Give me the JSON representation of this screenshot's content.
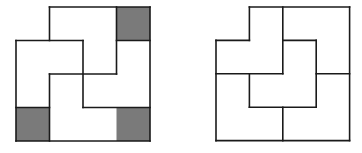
{
  "figures": [
    {
      "name": "left-puzzle",
      "origin": [
        16,
        7
      ],
      "unit": 33.5,
      "shaded_cells": [
        [
          3,
          0
        ],
        [
          0,
          3
        ],
        [
          3,
          3
        ]
      ],
      "shade_color": "#7a7a7a",
      "segments": [
        [
          1,
          0,
          4,
          0
        ],
        [
          4,
          0,
          4,
          4
        ],
        [
          0,
          4,
          4,
          4
        ],
        [
          0,
          1,
          0,
          4
        ],
        [
          0,
          1,
          2,
          1
        ],
        [
          1,
          0,
          1,
          1
        ],
        [
          2,
          1,
          2,
          3
        ],
        [
          1,
          2,
          3,
          2
        ],
        [
          3,
          0,
          3,
          2
        ],
        [
          3,
          1,
          4,
          1
        ],
        [
          1,
          2,
          1,
          4
        ],
        [
          2,
          3,
          4,
          3
        ],
        [
          0,
          3,
          1,
          3
        ]
      ]
    },
    {
      "name": "right-puzzle",
      "origin": [
        216,
        7
      ],
      "unit": 33.4,
      "shaded_cells": [],
      "shade_color": "#7a7a7a",
      "segments": [
        [
          1,
          0,
          4,
          0
        ],
        [
          4,
          0,
          4,
          4
        ],
        [
          0,
          4,
          4,
          4
        ],
        [
          0,
          1,
          0,
          4
        ],
        [
          0,
          1,
          1,
          1
        ],
        [
          1,
          1,
          1,
          0
        ],
        [
          2,
          0,
          2,
          2
        ],
        [
          0,
          2,
          2,
          2
        ],
        [
          2,
          1,
          3,
          1
        ],
        [
          3,
          1,
          3,
          3
        ],
        [
          1,
          3,
          3,
          3
        ],
        [
          1,
          2,
          1,
          3
        ],
        [
          3,
          2,
          4,
          2
        ],
        [
          2,
          3,
          2,
          4
        ]
      ]
    }
  ],
  "line_color": "#1a1a1a"
}
